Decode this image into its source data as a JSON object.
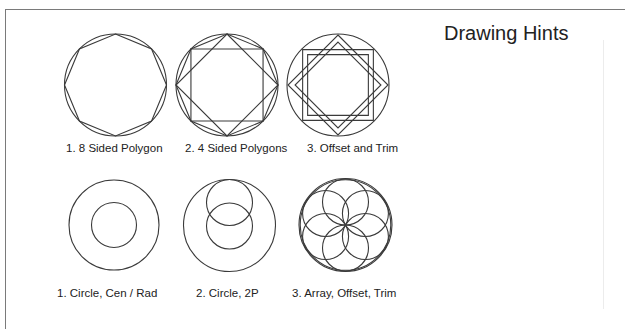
{
  "title": "Drawing Hints",
  "stroke_color": "#3a3a3a",
  "figures": {
    "top": [
      {
        "label": "1.  8 Sided Polygon",
        "shape": "circle-with-inscribed-octagon"
      },
      {
        "label": "2.  4 Sided Polygons",
        "shape": "circle-with-octagon-square-diamond"
      },
      {
        "label": "3.  Offset and Trim",
        "shape": "circle-with-interlaced-offset-squares"
      }
    ],
    "bottom": [
      {
        "label": "1.  Circle, Cen / Rad",
        "shape": "concentric-circles"
      },
      {
        "label": "2.  Circle, 2P",
        "shape": "circle-with-two-overlapping-circles"
      },
      {
        "label": "3.  Array, Offset, Trim",
        "shape": "seed-of-life-circle-array"
      }
    ]
  }
}
